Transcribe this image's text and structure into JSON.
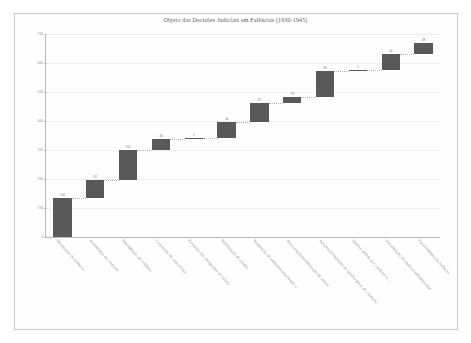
{
  "chart_data": {
    "type": "bar",
    "subtype": "waterfall",
    "title": "Objeto das Decisões Judiciais em Falências (1930-1945)",
    "xlabel": "",
    "ylabel": "",
    "ylim": [
      0,
      700
    ],
    "yticks": [
      0,
      100,
      200,
      300,
      400,
      500,
      600,
      700
    ],
    "ytick_labels": [
      "0",
      "100",
      "200",
      "300",
      "400",
      "500",
      "600",
      "700"
    ],
    "grid": true,
    "legend": false,
    "categories": [
      "Decretação de falência",
      "Assembleia de credores",
      "Impugnação de créditos",
      "Concessão de concordata",
      "Extinção das obrigações do falido",
      "Habilitação de crédito",
      "Nomeação de administrador/síndico",
      "Arrecadação/arrematação de ativos",
      "Aprovação/rejeição do quadro geral de credores",
      "Quebra pedida por credores e...",
      "Substituição de síndico/administrador",
      "Encerramento da falência"
    ],
    "values": [
      136,
      62,
      103,
      36,
      5,
      54,
      67,
      19,
      89,
      5,
      56,
      38
    ],
    "cumulative_start": [
      0,
      136,
      198,
      301,
      337,
      342,
      396,
      463,
      482,
      571,
      576,
      632
    ],
    "cumulative_end": [
      136,
      198,
      301,
      337,
      342,
      396,
      463,
      482,
      571,
      576,
      632,
      670
    ],
    "value_labels": [
      "136",
      "62",
      "103",
      "36",
      "5",
      "54",
      "67",
      "19",
      "89",
      "5",
      "56",
      "38"
    ],
    "bar_color": "#595959",
    "grid_color": "#e2e2e2",
    "axis_color": "#b9b9b9",
    "text_color": "#8a8a8a",
    "background": "#ffffff"
  }
}
